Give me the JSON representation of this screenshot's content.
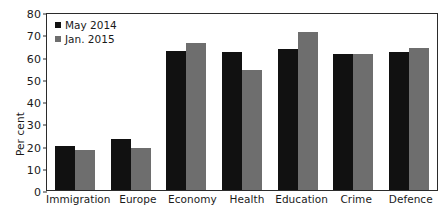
{
  "chart_data": {
    "type": "bar",
    "title": "",
    "xlabel": "",
    "ylabel": "Per cent",
    "ylim": [
      0,
      80
    ],
    "yticks": [
      0,
      10,
      20,
      30,
      40,
      50,
      60,
      70,
      80
    ],
    "ytick_labels": [
      "0",
      "10",
      "20",
      "30",
      "40",
      "50",
      "60",
      "70",
      "80"
    ],
    "grid": false,
    "legend_position": "top-left",
    "categories": [
      "Immigration",
      "Europe",
      "Economy",
      "Health",
      "Education",
      "Crime",
      "Defence"
    ],
    "series": [
      {
        "name": "May 2014",
        "color": "#111111",
        "values": [
          20,
          23,
          62.5,
          62,
          63.5,
          61,
          62
        ]
      },
      {
        "name": "Jan. 2015",
        "color": "#6e6e6e",
        "values": [
          18,
          19,
          66,
          54,
          71,
          61,
          64
        ]
      }
    ]
  },
  "axis": {
    "y_title": "Per cent"
  },
  "legend": {
    "entries": [
      {
        "label": "May 2014"
      },
      {
        "label": "Jan. 2015"
      }
    ]
  }
}
